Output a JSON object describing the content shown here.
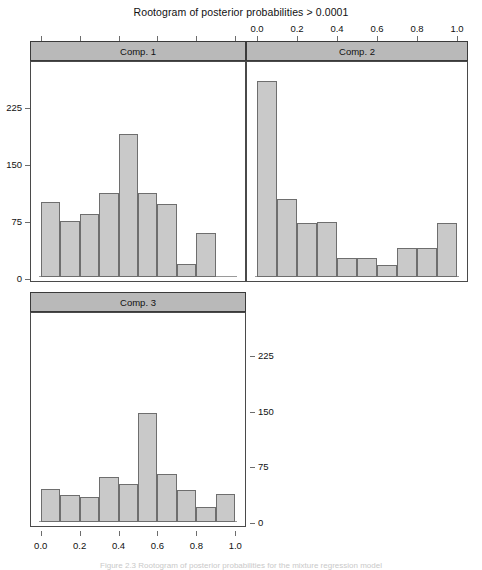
{
  "figure": {
    "title": "Rootogram of posterior probabilities > 0.0001",
    "caption": "Figure 2.3   Rootogram of posterior probabilities for the mixture regression model"
  },
  "chart_data": {
    "type": "bar",
    "title": "Rootogram of posterior probabilities > 0.0001",
    "xlabel": "",
    "ylabel": "",
    "xlim": [
      -0.05,
      1.05
    ],
    "ylim": [
      0,
      280
    ],
    "xticks": [
      "0.0",
      "0.2",
      "0.4",
      "0.6",
      "0.8",
      "1.0"
    ],
    "xtick_values": [
      0.0,
      0.2,
      0.4,
      0.6,
      0.8,
      1.0
    ],
    "yticks": [
      "0",
      "75",
      "150",
      "225"
    ],
    "ytick_values": [
      0,
      75,
      150,
      225
    ],
    "grid": false,
    "legend": "none",
    "layout": "3 panels, 2x2 lattice (Comp. 1 top-left, Comp. 2 top-right, Comp. 3 bottom-left)",
    "bin_width": 0.1,
    "panels": [
      {
        "name": "Comp. 1",
        "bin_starts": [
          0.0,
          0.1,
          0.2,
          0.3,
          0.4,
          0.5,
          0.6,
          0.7,
          0.8
        ],
        "values": [
          100,
          75,
          85,
          113,
          191,
          113,
          98,
          18,
          59
        ]
      },
      {
        "name": "Comp. 2",
        "bin_starts": [
          0.0,
          0.1,
          0.2,
          0.3,
          0.4,
          0.5,
          0.6,
          0.7,
          0.8,
          0.9
        ],
        "values": [
          263,
          104,
          73,
          74,
          25,
          25,
          16,
          39,
          39,
          73
        ]
      },
      {
        "name": "Comp. 3",
        "bin_starts": [
          0.0,
          0.1,
          0.2,
          0.3,
          0.4,
          0.5,
          0.6,
          0.7,
          0.8,
          0.9
        ],
        "values": [
          46,
          37,
          34,
          62,
          52,
          150,
          66,
          44,
          21,
          38
        ]
      }
    ]
  },
  "axes": {
    "top": {
      "labels": [
        "0.0",
        "0.2",
        "0.4",
        "0.6",
        "0.8",
        "1.0"
      ]
    },
    "bottom": {
      "labels": [
        "0.0",
        "0.2",
        "0.4",
        "0.6",
        "0.8",
        "1.0"
      ]
    },
    "left": {
      "labels": [
        "225",
        "150",
        "75",
        "0"
      ]
    },
    "right": {
      "labels": [
        "225",
        "150",
        "75",
        "0"
      ]
    }
  },
  "strips": {
    "comp1": "Comp. 1",
    "comp2": "Comp. 2",
    "comp3": "Comp. 3"
  }
}
